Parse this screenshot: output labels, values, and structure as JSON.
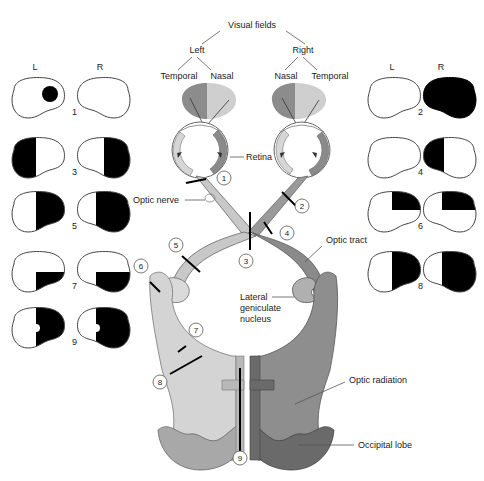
{
  "diagram": {
    "title": "Visual fields",
    "hierarchy": {
      "left": {
        "label": "Left",
        "temporal": "Temporal",
        "nasal": "Nasal"
      },
      "right": {
        "label": "Right",
        "nasal": "Nasal",
        "temporal": "Temporal"
      }
    },
    "labels": {
      "retina": "Retina",
      "optic_nerve": "Optic nerve",
      "optic_tract": "Optic tract",
      "lgn_line1": "Lateral",
      "lgn_line2": "geniculate",
      "lgn_line3": "nucleus",
      "optic_radiation": "Optic radiation",
      "occipital_lobe": "Occipital lobe"
    },
    "field_column_headers": {
      "left": "L",
      "right": "R"
    },
    "lesion_sites": [
      "1",
      "2",
      "3",
      "4",
      "5",
      "6",
      "7",
      "8",
      "9"
    ],
    "field_defects": [
      {
        "id": "1",
        "left": "central scotoma",
        "right": "normal"
      },
      {
        "id": "2",
        "left": "normal",
        "right": "complete blindness"
      },
      {
        "id": "3",
        "left": "temporal hemianopia",
        "right": "temporal hemianopia"
      },
      {
        "id": "4",
        "left": "normal",
        "right": "nasal hemianopia"
      },
      {
        "id": "5",
        "left": "right homonymous hemianopia",
        "right": "right homonymous hemianopia"
      },
      {
        "id": "6",
        "left": "right upper quadrantanopia",
        "right": "right upper quadrantanopia"
      },
      {
        "id": "7",
        "left": "right lower quadrantanopia",
        "right": "right lower quadrantanopia"
      },
      {
        "id": "8",
        "left": "right homonymous hemianopia",
        "right": "right homonymous hemianopia"
      },
      {
        "id": "9",
        "left": "right hemianopia with macular sparing",
        "right": "right hemianopia with macular sparing"
      }
    ],
    "colors": {
      "left_pathway_light": "#d6d6d6",
      "left_pathway_mid": "#b4b4b4",
      "right_pathway_dark": "#7e7e7e",
      "right_pathway_mid": "#9c9c9c",
      "defect": "#000000"
    }
  }
}
